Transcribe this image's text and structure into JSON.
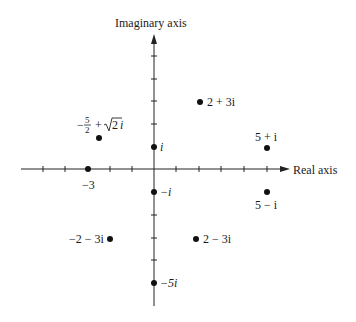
{
  "diagram": {
    "type": "complex-plane",
    "x_axis_label": "Real axis",
    "y_axis_label": "Imaginary axis",
    "x_ticks": [
      -6,
      -5,
      -4,
      -3,
      -2,
      -1,
      1,
      2,
      3,
      4,
      5
    ],
    "y_ticks": [
      6,
      5,
      4,
      3,
      2,
      1,
      -1,
      -2,
      -3,
      -4,
      -5
    ],
    "tick_label_minus_three": "−3",
    "points": [
      {
        "name": "i",
        "re": 0,
        "im": 1,
        "label": "i"
      },
      {
        "name": "minus-i",
        "re": 0,
        "im": -1,
        "label": "−i"
      },
      {
        "name": "minus-5i",
        "re": 0,
        "im": -5,
        "label": "−5i"
      },
      {
        "name": "minus-3",
        "re": -3,
        "im": 0,
        "label": "−3"
      },
      {
        "name": "2-plus-3i",
        "re": 2,
        "im": 3,
        "label": "2 + 3i"
      },
      {
        "name": "5-plus-i",
        "re": 5,
        "im": 1,
        "label": "5 + i"
      },
      {
        "name": "5-minus-i",
        "re": 5,
        "im": -1,
        "label": "5 − i"
      },
      {
        "name": "minus-2-minus-3i",
        "re": -2,
        "im": -3,
        "label": "−2 − 3i"
      },
      {
        "name": "2-minus-3i",
        "re": 2,
        "im": -3,
        "label": "2 − 3i"
      },
      {
        "name": "minus-5-over-2-plus-sqrt2-i",
        "re": -2.5,
        "im": 1.414,
        "label": "−5/2 + √2i"
      }
    ],
    "labels": {
      "i": "i",
      "minus_i": "−i",
      "minus_5i": "−5i",
      "minus_3": "−3",
      "p_2_3i": "2 + 3i",
      "p_5_i": "5 + i",
      "p_5_mi": "5 − i",
      "p_m2_m3i": "−2 − 3i",
      "p_2_m3i": "2 − 3i",
      "frac_minus": "−",
      "frac_num": "5",
      "frac_den": "2",
      "sqrt_plus": "+",
      "sqrt_radicand": "2",
      "sqrt_i": "i"
    }
  }
}
